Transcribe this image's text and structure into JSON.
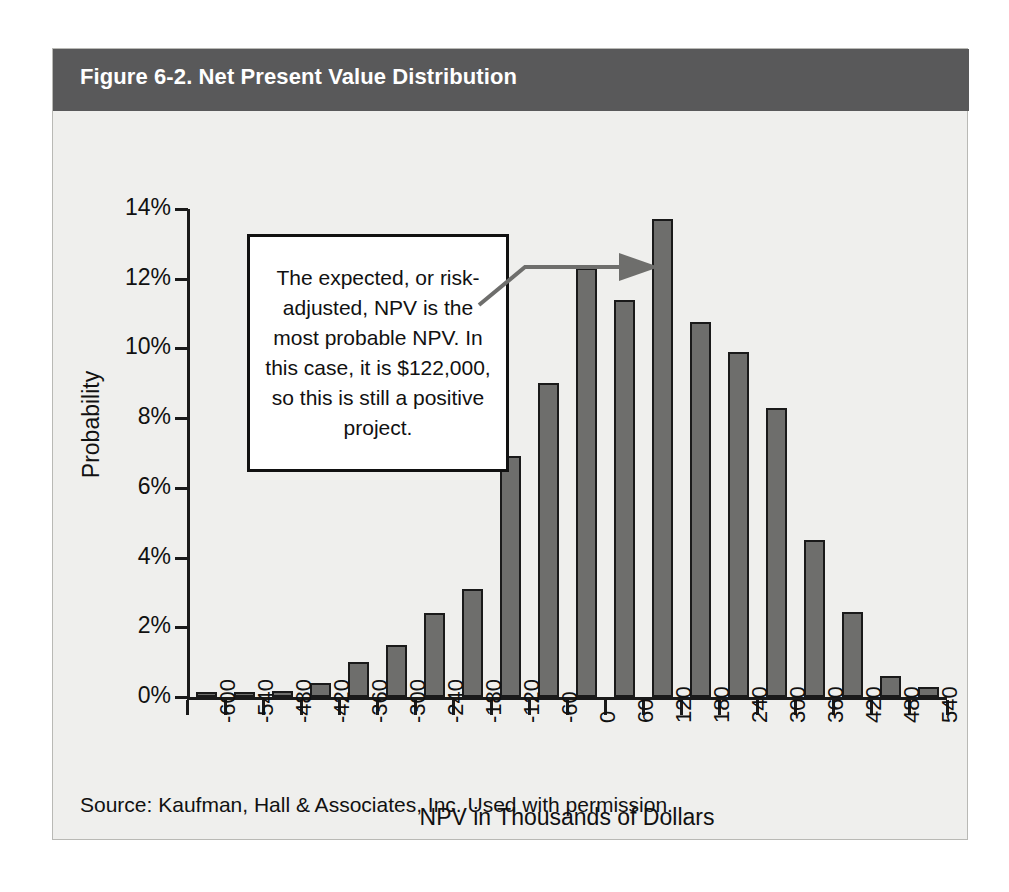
{
  "figure": {
    "title": "Figure 6-2. Net Present Value Distribution",
    "source_note": "Source: Kaufman, Hall & Associates, Inc. Used with permission.",
    "title_bar_color": "#59595a",
    "background_color": "#efefed",
    "bar_fill_color": "#6e6e6c",
    "bar_outline_color": "#1a1a1a",
    "callout_border_color": "#111111",
    "arrow_color": "#6e6e6c"
  },
  "callout": {
    "text": "The expected, or risk-adjusted, NPV is the most probable NPV. In this case, it is $122,000, so this is still a positive project."
  },
  "chart_data": {
    "type": "bar",
    "title": "Figure 6-2. Net Present Value Distribution",
    "xlabel": "NPV in Thousands of Dollars",
    "ylabel": "Probability",
    "categories": [
      "-600",
      "-540",
      "-480",
      "-420",
      "-360",
      "-300",
      "-240",
      "-180",
      "-120",
      "-60",
      "0",
      "60",
      "120",
      "180",
      "240",
      "300",
      "360",
      "420",
      "480",
      "540"
    ],
    "values": [
      0.1,
      0.13,
      0.17,
      0.4,
      1.0,
      1.5,
      2.4,
      3.1,
      6.9,
      9.0,
      12.3,
      11.4,
      13.7,
      10.75,
      9.9,
      8.3,
      4.5,
      2.45,
      0.6,
      0.3
    ],
    "ylim": [
      0,
      14
    ],
    "ytick_labels": [
      "14%",
      "12%",
      "10%",
      "8%",
      "6%",
      "4%",
      "2%",
      "0%"
    ],
    "ytick_values": [
      14,
      12,
      10,
      8,
      6,
      4,
      2,
      0
    ],
    "grid": false,
    "legend": "none",
    "annotations": [
      {
        "text": "The expected, or risk-adjusted, NPV is the most probable NPV. In this case, it is $122,000, so this is still a positive project.",
        "points_to_category": "120",
        "points_to_value": 13.7
      }
    ]
  }
}
